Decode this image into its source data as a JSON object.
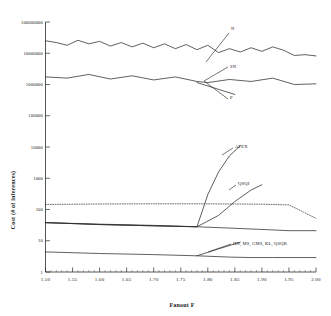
{
  "chart_data": {
    "type": "line",
    "title": "",
    "xlabel": "Fanout F",
    "ylabel": "Cost (# of inferences)",
    "yscale": "log",
    "xlim": [
      1.5,
      2.0
    ],
    "ylim": [
      1,
      100000000
    ],
    "grid": false,
    "legend_position": "inline-annotations",
    "xticks": [
      "1.50",
      "1.55",
      "1.60",
      "1.65",
      "1.70",
      "1.75",
      "1.80",
      "1.85",
      "1.90",
      "1.95",
      "2.00"
    ],
    "yticks": [
      "1",
      "10",
      "100",
      "1000",
      "10000",
      "100000",
      "1000000",
      "10000000",
      "100000000"
    ],
    "series": [
      {
        "name": "N",
        "style": "solid",
        "x": [
          1.5,
          1.52,
          1.54,
          1.56,
          1.58,
          1.6,
          1.62,
          1.64,
          1.66,
          1.68,
          1.7,
          1.72,
          1.74,
          1.76,
          1.78,
          1.8,
          1.82,
          1.84,
          1.86,
          1.88,
          1.9,
          1.92,
          1.94,
          1.96,
          1.98,
          2.0
        ],
        "y": [
          25000000,
          22000000,
          18000000,
          26000000,
          20000000,
          24000000,
          17000000,
          22000000,
          16000000,
          21000000,
          15000000,
          20000000,
          14000000,
          19000000,
          13000000,
          18000000,
          10500000,
          14000000,
          11000000,
          15000000,
          11500000,
          16000000,
          12500000,
          8500000,
          9000000,
          8200000
        ]
      },
      {
        "name": "SN",
        "style": "solid",
        "x": [
          1.5,
          1.54,
          1.58,
          1.62,
          1.66,
          1.7,
          1.74,
          1.78,
          1.8,
          1.84,
          1.88,
          1.92,
          1.96,
          2.0
        ],
        "y": [
          1750000,
          1600000,
          2100000,
          1500000,
          1900000,
          1400000,
          1750000,
          1250000,
          1150000,
          1450000,
          1250000,
          1600000,
          1000000,
          1050000
        ]
      },
      {
        "name": "P",
        "style": "solid",
        "x": [
          1.78,
          1.85
        ],
        "y": [
          1150000,
          480000
        ]
      },
      {
        "name": "APEX",
        "style": "solid",
        "x": [
          1.5,
          1.6,
          1.7,
          1.78,
          1.8,
          1.82,
          1.84,
          1.86
        ],
        "y": [
          38,
          33,
          30,
          28,
          300,
          1600,
          5200,
          11000
        ]
      },
      {
        "name": "QSQI",
        "style": "solid",
        "x": [
          1.5,
          1.6,
          1.7,
          1.78,
          1.82,
          1.85,
          1.88,
          1.9
        ],
        "y": [
          38,
          33,
          30,
          28,
          65,
          180,
          420,
          620
        ]
      },
      {
        "name": "QSQR-dotted",
        "style": "dotted",
        "x": [
          1.5,
          1.6,
          1.7,
          1.78,
          1.85,
          1.9,
          1.95,
          1.97,
          2.0
        ],
        "y": [
          145,
          150,
          152,
          152,
          150,
          148,
          140,
          95,
          52
        ]
      },
      {
        "name": "declining-solid",
        "style": "solid",
        "x": [
          1.5,
          1.6,
          1.7,
          1.78,
          1.85,
          1.9,
          1.95,
          2.0
        ],
        "y": [
          38,
          34,
          31,
          28,
          25,
          23,
          21,
          21
        ]
      },
      {
        "name": "HN, MS, GMS, KL, QSQR",
        "style": "solid",
        "x": [
          1.5,
          1.6,
          1.7,
          1.78,
          1.84,
          1.88,
          1.92,
          2.0
        ],
        "y": [
          4.4,
          3.9,
          3.6,
          3.3,
          3.0,
          2.9,
          2.9,
          2.9
        ]
      },
      {
        "name": "HN-branch",
        "style": "solid",
        "x": [
          1.78,
          1.82,
          1.86
        ],
        "y": [
          3.3,
          5.5,
          9.0
        ]
      }
    ],
    "annotations": [
      {
        "label": "N",
        "x": 231,
        "y": 30
      },
      {
        "label": "SN",
        "x": 230,
        "y": 68
      },
      {
        "label": "P",
        "x": 230,
        "y": 99
      },
      {
        "label": "APEX",
        "x": 235,
        "y": 148
      },
      {
        "label": "QSQI",
        "x": 238,
        "y": 185
      },
      {
        "label": "HN, MS, GMS, KL, QSQR",
        "x": 233,
        "y": 245
      }
    ]
  }
}
